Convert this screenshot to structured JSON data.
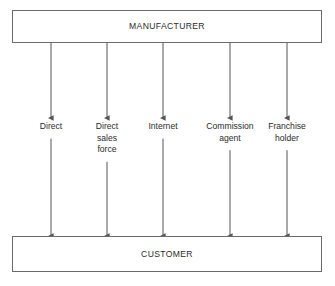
{
  "diagram": {
    "source_node": {
      "id": "manufacturer",
      "label": "MANUFACTURER"
    },
    "target_node": {
      "id": "customer",
      "label": "CUSTOMER"
    },
    "channels": [
      {
        "id": "direct",
        "lines": [
          "Direct"
        ],
        "x": 51
      },
      {
        "id": "direct-sales-force",
        "lines": [
          "Direct",
          "sales",
          "force"
        ],
        "x": 107
      },
      {
        "id": "internet",
        "lines": [
          "Internet"
        ],
        "x": 163
      },
      {
        "id": "commission-agent",
        "lines": [
          "Commission",
          "agent"
        ],
        "x": 230
      },
      {
        "id": "franchise-holder",
        "lines": [
          "Franchise",
          "holder"
        ],
        "x": 287
      }
    ],
    "colors": {
      "stroke": "#6b6b6b",
      "arrow": "#555555",
      "text": "#2b2b2b",
      "background": "#ffffff"
    }
  }
}
